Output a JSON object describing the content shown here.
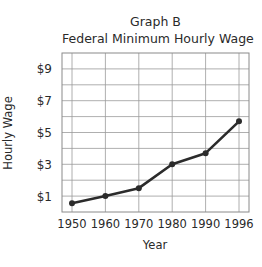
{
  "chart_data": {
    "type": "line",
    "title": "Graph B",
    "subtitle": "Federal Minimum Hourly Wage",
    "xlabel": "Year",
    "ylabel": "Hourly Wage",
    "categories": [
      "1950",
      "1960",
      "1970",
      "1980",
      "1990",
      "1996"
    ],
    "series": [
      {
        "name": "Federal Minimum Hourly Wage",
        "values": [
          0.55,
          1.0,
          1.5,
          3.0,
          3.7,
          5.7
        ]
      }
    ],
    "yticks": [
      1,
      3,
      5,
      7,
      9
    ],
    "ytick_labels": [
      "$1",
      "$3",
      "$5",
      "$7",
      "$9"
    ],
    "ylim": [
      0,
      10
    ],
    "grid": true,
    "line_color": "#2b2b2b",
    "grid_color": "#9a9a9a"
  }
}
